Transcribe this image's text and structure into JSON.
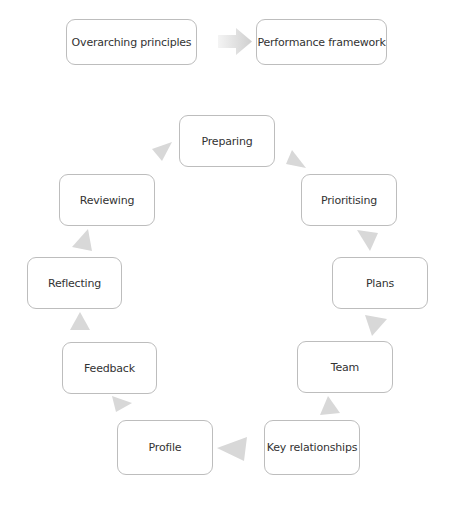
{
  "top_flow": {
    "source": "Overarching principles",
    "target": "Performance framework"
  },
  "cycle": {
    "nodes": [
      {
        "id": "preparing",
        "label": "Preparing"
      },
      {
        "id": "prioritising",
        "label": "Prioritising"
      },
      {
        "id": "plans",
        "label": "Plans"
      },
      {
        "id": "team",
        "label": "Team"
      },
      {
        "id": "key_relationships",
        "label": "Key relationships"
      },
      {
        "id": "profile",
        "label": "Profile"
      },
      {
        "id": "feedback",
        "label": "Feedback"
      },
      {
        "id": "reflecting",
        "label": "Reflecting"
      },
      {
        "id": "reviewing",
        "label": "Reviewing"
      }
    ],
    "direction": "clockwise"
  },
  "colors": {
    "box_border": "#bdbdbd",
    "text": "#333333",
    "arrow": "#d6d6d6"
  }
}
